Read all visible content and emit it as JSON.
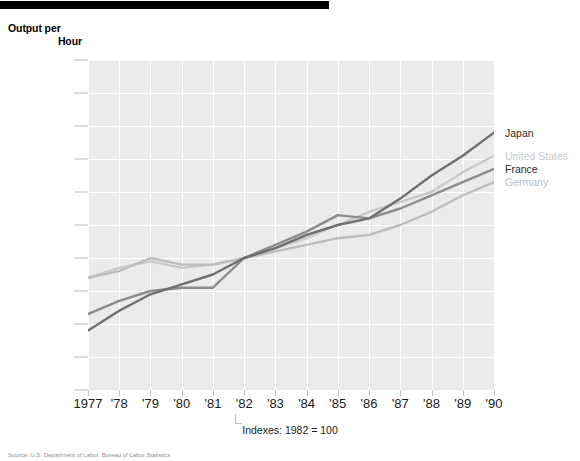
{
  "header": {
    "rule": "black-bar"
  },
  "axis_title": {
    "line1": "Output per",
    "line2": "Hour"
  },
  "index_note": "Indexes: 1982 = 100",
  "source_note": "Source: U.S. Department of Labor, Bureau of Labor Statistics",
  "legend": [
    {
      "label": "Japan",
      "color": "#6e6e6e",
      "value": 138
    },
    {
      "label": "United States",
      "color": "#c9c9c9",
      "value": 131
    },
    {
      "label": "France",
      "color": "#8c8c8c",
      "value": 127
    },
    {
      "label": "Germany",
      "color": "#bdbdbd",
      "value": 123
    }
  ],
  "chart_data": {
    "type": "line",
    "title": "Output per Hour",
    "subtitle": "Indexes: 1982 = 100",
    "xlabel": "",
    "ylabel": "Output per Hour",
    "x": [
      1977,
      1978,
      1979,
      1980,
      1981,
      1982,
      1983,
      1984,
      1985,
      1986,
      1987,
      1988,
      1989,
      1990
    ],
    "tick_labels": [
      "1977",
      "'78",
      "'79",
      "'80",
      "'81",
      "'82",
      "'83",
      "'84",
      "'85",
      "'86",
      "'87",
      "'88",
      "'89",
      "'90"
    ],
    "ylim": [
      60,
      160
    ],
    "yticks": [
      60,
      70,
      80,
      90,
      100,
      110,
      120,
      130,
      140,
      150,
      160
    ],
    "grid": true,
    "legend_position": "right-inline",
    "series": [
      {
        "name": "Japan",
        "color": "#6e6e6e",
        "values": [
          78,
          84,
          89,
          92,
          95,
          100,
          103,
          107,
          110,
          112,
          118,
          125,
          131,
          138
        ]
      },
      {
        "name": "United States",
        "color": "#c9c9c9",
        "values": [
          94,
          97,
          99,
          97,
          98,
          100,
          103,
          106,
          110,
          114,
          117,
          120,
          126,
          131
        ]
      },
      {
        "name": "France",
        "color": "#8c8c8c",
        "values": [
          83,
          87,
          90,
          91,
          91,
          100,
          104,
          108,
          113,
          112,
          115,
          119,
          123,
          127
        ]
      },
      {
        "name": "Germany",
        "color": "#bdbdbd",
        "values": [
          94,
          96,
          100,
          98,
          98,
          100,
          102,
          104,
          106,
          107,
          110,
          114,
          119,
          123
        ]
      }
    ]
  }
}
